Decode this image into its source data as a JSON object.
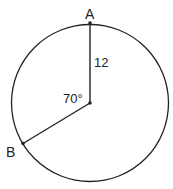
{
  "diagram": {
    "type": "circle-geometry",
    "colors": {
      "stroke": "#222222",
      "background": "#ffffff"
    },
    "points": {
      "A": {
        "label": "A"
      },
      "B": {
        "label": "B"
      }
    },
    "radius_label": "12",
    "angle_label": "70°"
  }
}
